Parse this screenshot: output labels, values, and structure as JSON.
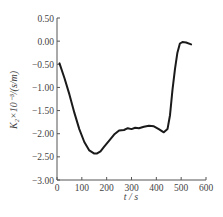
{
  "chart_data": {
    "type": "line",
    "title": "",
    "xlabel": "t / s",
    "ylabel": "K₂×10⁻³/(s/m)",
    "xlim": [
      0,
      600
    ],
    "ylim": [
      -3.0,
      0.5
    ],
    "xticks": [
      "0",
      "100",
      "200",
      "300",
      "400",
      "500",
      "600"
    ],
    "yticks": [
      "0.50",
      "0.00",
      "-0.50",
      "-1.00",
      "-1.50",
      "-2.00",
      "-2.50",
      "-3.00"
    ],
    "grid": false,
    "legend": null,
    "series": [
      {
        "name": "K2",
        "color": "#1a1a1a",
        "x": [
          10,
          30,
          50,
          70,
          90,
          110,
          130,
          150,
          160,
          175,
          190,
          210,
          230,
          250,
          270,
          285,
          300,
          315,
          330,
          350,
          370,
          390,
          410,
          430,
          445,
          455,
          465,
          475,
          485,
          495,
          505,
          520,
          540
        ],
        "y": [
          -0.48,
          -0.8,
          -1.15,
          -1.55,
          -1.9,
          -2.18,
          -2.36,
          -2.43,
          -2.43,
          -2.38,
          -2.28,
          -2.15,
          -2.02,
          -1.93,
          -1.92,
          -1.88,
          -1.9,
          -1.87,
          -1.88,
          -1.85,
          -1.83,
          -1.84,
          -1.9,
          -1.97,
          -1.9,
          -1.6,
          -1.05,
          -0.6,
          -0.25,
          -0.05,
          -0.02,
          -0.03,
          -0.07
        ]
      }
    ]
  }
}
